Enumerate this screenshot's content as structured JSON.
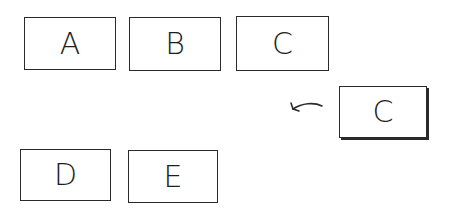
{
  "diagram": {
    "row1": [
      {
        "label": "A"
      },
      {
        "label": "B"
      },
      {
        "label": "C"
      }
    ],
    "moving_card": {
      "label": "C",
      "direction": "left"
    },
    "row2": [
      {
        "label": "D"
      },
      {
        "label": "E"
      }
    ],
    "colors": {
      "stroke": "#2a2a2a",
      "background": "#ffffff"
    }
  }
}
